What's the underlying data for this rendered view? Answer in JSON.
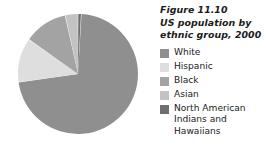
{
  "figure": {
    "title": "Figure 11.10\nUS population by\nethnic group, 2000"
  },
  "legend": {
    "items": [
      {
        "label": "White",
        "color": "#8f8f8f"
      },
      {
        "label": "Hispanic",
        "color": "#dedede"
      },
      {
        "label": "Black",
        "color": "#a3a3a3"
      },
      {
        "label": "Asian",
        "color": "#c3c3c3"
      },
      {
        "label": "North American\nIndians and\nHawaiians",
        "color": "#6f6f6f"
      }
    ]
  },
  "chart_data": {
    "type": "pie",
    "title": "Figure 11.10 US population by ethnic group, 2000",
    "xlabel": "",
    "ylabel": "",
    "legend_position": "right",
    "grid": false,
    "start_angle_deg": -90,
    "direction": "clockwise",
    "categories": [
      "White",
      "Hispanic",
      "Black",
      "Asian",
      "North American Indians and Hawaiians"
    ],
    "values": [
      75.1,
      12.5,
      12.3,
      3.6,
      0.9
    ],
    "unit": "percent",
    "colors": [
      "#8f8f8f",
      "#dedede",
      "#a3a3a3",
      "#c3c3c3",
      "#6f6f6f"
    ],
    "slice_order_clockwise_from_top": [
      {
        "name": "North American Indians and Hawaiians",
        "value": 0.9,
        "color": "#6f6f6f"
      },
      {
        "name": "White",
        "value": 75.1,
        "color": "#8f8f8f"
      },
      {
        "name": "Hispanic",
        "value": 12.5,
        "color": "#dedede"
      },
      {
        "name": "Black",
        "value": 12.3,
        "color": "#a3a3a3"
      },
      {
        "name": "Asian",
        "value": 3.6,
        "color": "#c3c3c3"
      }
    ]
  }
}
